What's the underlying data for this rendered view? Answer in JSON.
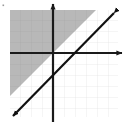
{
  "figure": {
    "title": "",
    "width": 127,
    "height": 125,
    "background_color": "#ffffff",
    "corner_mark": {
      "present": true,
      "x": 3,
      "y": 5,
      "color": "#9a9a9a"
    }
  },
  "chart_data": {
    "type": "line",
    "title": "",
    "xlabel": "",
    "ylabel": "",
    "grid": true,
    "legend": "none",
    "xlim": [
      -4,
      6
    ],
    "ylim": [
      -6,
      4
    ],
    "origin_px": {
      "x": 53,
      "y": 53
    },
    "grid_spacing_px": 11,
    "plot_area_px": {
      "left": 10,
      "top": 10,
      "right": 118,
      "bottom": 117
    },
    "axes": {
      "x_axis": {
        "label": "x",
        "y_px": 53,
        "from_px": 10,
        "to_px": 122,
        "color": "#1a1a1a",
        "width_px": 2.2,
        "arrow": "right"
      },
      "y_axis": {
        "label": "y",
        "x_px": 53,
        "from_px": 122,
        "to_px": 4,
        "color": "#1a1a1a",
        "width_px": 2.2,
        "arrow": "up"
      }
    },
    "series": [
      {
        "name": "y = x",
        "equation": "y = x",
        "slope": 1,
        "intercept": 0,
        "style": "solid",
        "color": "#111111",
        "width_px": 2.2,
        "arrows": "both",
        "endpoints_px": [
          {
            "x": 11,
            "y": 118
          },
          {
            "x": 115,
            "y": 12
          }
        ],
        "points": [
          {
            "x": -4,
            "y": -4
          },
          {
            "x": 0,
            "y": 0
          },
          {
            "x": 6,
            "y": 6
          }
        ]
      }
    ],
    "shaded_region": {
      "name": "solution-region",
      "inequality": "y >= x",
      "side": "above-left",
      "fill_color": "#b8b8b8",
      "boundary": "solid",
      "boundary_included": true
    },
    "gridlines": {
      "shaded_color": "#a8a8a8",
      "unshaded_color": "#e2e2e2",
      "width_px": 0.7
    }
  }
}
